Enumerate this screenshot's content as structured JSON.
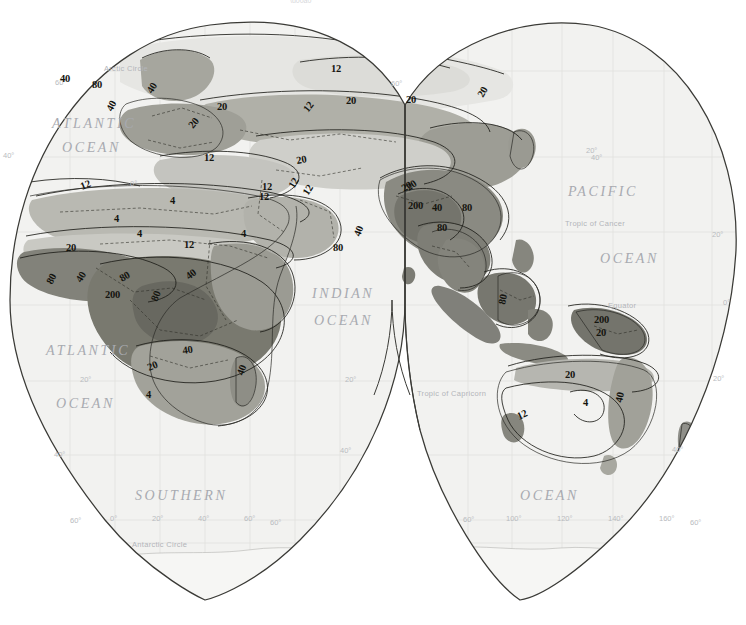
{
  "map": {
    "title": "World annual precipitation map (Eastern Hemisphere)",
    "projection": "Goode homolosine interrupted",
    "background_color": "#ffffff",
    "paper_tint": "#f2f2f0",
    "outline_color": "#3a3a38",
    "graticule_color": "#dcdcda",
    "shade_palette": {
      "lightest": "#f3f3f1",
      "light": "#e2e2df",
      "mid_light": "#c9c9c4",
      "mid": "#b5b5ae",
      "mid_dark": "#9a9a92",
      "dark": "#83837b",
      "darkest": "#6f6f67"
    },
    "isoline_color": "#1b1b16"
  },
  "ocean_labels": [
    {
      "text": "ATLANTIC",
      "x": 52,
      "y": 128
    },
    {
      "text": "OCEAN",
      "x": 62,
      "y": 152
    },
    {
      "text": "ATLANTIC",
      "x": 46,
      "y": 355
    },
    {
      "text": "OCEAN",
      "x": 56,
      "y": 408
    },
    {
      "text": "INDIAN",
      "x": 312,
      "y": 298
    },
    {
      "text": "OCEAN",
      "x": 314,
      "y": 325
    },
    {
      "text": "PACIFIC",
      "x": 568,
      "y": 196
    },
    {
      "text": "OCEAN",
      "x": 600,
      "y": 263
    },
    {
      "text": "SOUTHERN",
      "x": 135,
      "y": 500
    },
    {
      "text": "OCEAN",
      "x": 520,
      "y": 500
    }
  ],
  "reference_lines": [
    {
      "text": "Arctic Circle",
      "x": 104,
      "y": 71
    },
    {
      "text": "Tropic of Cancer",
      "x": 565,
      "y": 226
    },
    {
      "text": "Equator",
      "x": 608,
      "y": 308
    },
    {
      "text": "Tropic of Capricorn",
      "x": 417,
      "y": 396
    },
    {
      "text": "Antarctic Circle",
      "x": 132,
      "y": 547
    }
  ],
  "graticule_labels": [
    {
      "text": "60°",
      "x": 55,
      "y": 85
    },
    {
      "text": "40°",
      "x": 3,
      "y": 158
    },
    {
      "text": "20°",
      "x": 80,
      "y": 382
    },
    {
      "text": "40°",
      "x": 54,
      "y": 457
    },
    {
      "text": "60°",
      "x": 70,
      "y": 523
    },
    {
      "text": "0°",
      "x": 110,
      "y": 521
    },
    {
      "text": "20°",
      "x": 152,
      "y": 521
    },
    {
      "text": "40°",
      "x": 198,
      "y": 521
    },
    {
      "text": "60°",
      "x": 244,
      "y": 521
    },
    {
      "text": "60°",
      "x": 270,
      "y": 525
    },
    {
      "text": "20°",
      "x": 345,
      "y": 382
    },
    {
      "text": "40°",
      "x": 340,
      "y": 453
    },
    {
      "text": "60°",
      "x": 391,
      "y": 86
    },
    {
      "text": "40°",
      "x": 591,
      "y": 160
    },
    {
      "text": "20°",
      "x": 712,
      "y": 237
    },
    {
      "text": "0°",
      "x": 723,
      "y": 305
    },
    {
      "text": "20°",
      "x": 713,
      "y": 381
    },
    {
      "text": "40°",
      "x": 672,
      "y": 452
    },
    {
      "text": "60°",
      "x": 463,
      "y": 522
    },
    {
      "text": "100°",
      "x": 506,
      "y": 521
    },
    {
      "text": "120°",
      "x": 557,
      "y": 521
    },
    {
      "text": "140°",
      "x": 608,
      "y": 521
    },
    {
      "text": "160°",
      "x": 659,
      "y": 521
    },
    {
      "text": "60°",
      "x": 690,
      "y": 525
    },
    {
      "text": "20°",
      "x": 586,
      "y": 153
    },
    {
      "text": "0°",
      "x": 130,
      "y": 186
    }
  ],
  "isoline_labels": [
    {
      "value": "40",
      "x": 60,
      "y": 82,
      "rot": 0
    },
    {
      "value": "80",
      "x": 92,
      "y": 88,
      "rot": 0
    },
    {
      "value": "40",
      "x": 112,
      "y": 112,
      "rot": -62
    },
    {
      "value": "40",
      "x": 152,
      "y": 94,
      "rot": -58
    },
    {
      "value": "20",
      "x": 193,
      "y": 129,
      "rot": -50
    },
    {
      "value": "20",
      "x": 217,
      "y": 110,
      "rot": 0
    },
    {
      "value": "12",
      "x": 331,
      "y": 72,
      "rot": 0
    },
    {
      "value": "12",
      "x": 308,
      "y": 113,
      "rot": -52
    },
    {
      "value": "20",
      "x": 346,
      "y": 104,
      "rot": 0
    },
    {
      "value": "20",
      "x": 406,
      "y": 103,
      "rot": 0
    },
    {
      "value": "20",
      "x": 483,
      "y": 98,
      "rot": -60
    },
    {
      "value": "12",
      "x": 204,
      "y": 161,
      "rot": 0
    },
    {
      "value": "20",
      "x": 297,
      "y": 164,
      "rot": -10
    },
    {
      "value": "12",
      "x": 294,
      "y": 189,
      "rot": -60
    },
    {
      "value": "12",
      "x": 308,
      "y": 196,
      "rot": -58
    },
    {
      "value": "12",
      "x": 259,
      "y": 200,
      "rot": 0
    },
    {
      "value": "20",
      "x": 404,
      "y": 192,
      "rot": -30
    },
    {
      "value": "12",
      "x": 82,
      "y": 190,
      "rot": -22
    },
    {
      "value": "4",
      "x": 114,
      "y": 222,
      "rot": 0
    },
    {
      "value": "4",
      "x": 170,
      "y": 204,
      "rot": 0
    },
    {
      "value": "4",
      "x": 137,
      "y": 237,
      "rot": 0
    },
    {
      "value": "12",
      "x": 184,
      "y": 248,
      "rot": 0
    },
    {
      "value": "4",
      "x": 241,
      "y": 237,
      "rot": 0
    },
    {
      "value": "12",
      "x": 262,
      "y": 190,
      "rot": 0
    },
    {
      "value": "20",
      "x": 66,
      "y": 251,
      "rot": 0
    },
    {
      "value": "80",
      "x": 52,
      "y": 285,
      "rot": -62
    },
    {
      "value": "40",
      "x": 81,
      "y": 283,
      "rot": -58
    },
    {
      "value": "80",
      "x": 122,
      "y": 282,
      "rot": -30
    },
    {
      "value": "200",
      "x": 105,
      "y": 298,
      "rot": 0
    },
    {
      "value": "80",
      "x": 157,
      "y": 302,
      "rot": -68
    },
    {
      "value": "40",
      "x": 189,
      "y": 280,
      "rot": -38
    },
    {
      "value": "40",
      "x": 183,
      "y": 354,
      "rot": -8
    },
    {
      "value": "20",
      "x": 149,
      "y": 371,
      "rot": -22
    },
    {
      "value": "40",
      "x": 243,
      "y": 376,
      "rot": -70
    },
    {
      "value": "4",
      "x": 146,
      "y": 398,
      "rot": 0
    },
    {
      "value": "80",
      "x": 333,
      "y": 251,
      "rot": 0
    },
    {
      "value": "40",
      "x": 360,
      "y": 237,
      "rot": -70
    },
    {
      "value": "200",
      "x": 408,
      "y": 209,
      "rot": 0
    },
    {
      "value": "40",
      "x": 432,
      "y": 211,
      "rot": 0
    },
    {
      "value": "80",
      "x": 462,
      "y": 211,
      "rot": 0
    },
    {
      "value": "80",
      "x": 437,
      "y": 231,
      "rot": 0
    },
    {
      "value": "20",
      "x": 409,
      "y": 191,
      "rot": -35
    },
    {
      "value": "80",
      "x": 505,
      "y": 305,
      "rot": -78
    },
    {
      "value": "200",
      "x": 594,
      "y": 323
    },
    {
      "value": "20",
      "x": 596,
      "y": 336
    },
    {
      "value": "20",
      "x": 565,
      "y": 378,
      "rot": 0
    },
    {
      "value": "4",
      "x": 583,
      "y": 406,
      "rot": 0
    },
    {
      "value": "12",
      "x": 519,
      "y": 420,
      "rot": -25
    },
    {
      "value": "40",
      "x": 622,
      "y": 403,
      "rot": -78
    }
  ],
  "legend": {
    "units": "inches per year",
    "classes": [
      "under 4",
      "4 - 12",
      "12 - 20",
      "20 - 40",
      "40 - 80",
      "80 - 200",
      "over 200"
    ]
  }
}
